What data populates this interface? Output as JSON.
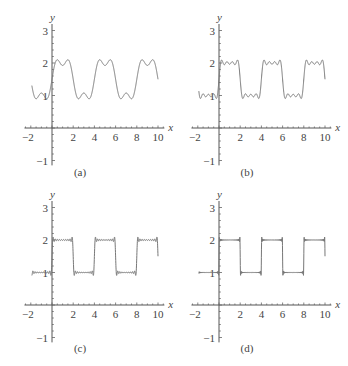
{
  "chart_data": [
    {
      "type": "line",
      "panel_label": "(a)",
      "title": "",
      "xlabel": "x",
      "ylabel": "y",
      "xlim": [
        -2,
        10
      ],
      "ylim": [
        -1,
        3
      ],
      "xticks": [
        "-2",
        "2",
        "4",
        "6",
        "8",
        "10"
      ],
      "yticks": [
        "3",
        "2",
        "1",
        "-1"
      ],
      "description": "Fourier partial sum of square wave (period 4, values 2 on (0,2), 1 on (2,4)), few terms",
      "harmonics": 3,
      "series": [
        {
          "name": "partial sum",
          "square_wave": {
            "high": 2,
            "low": 1,
            "period": 4
          }
        }
      ]
    },
    {
      "type": "line",
      "panel_label": "(b)",
      "xlabel": "x",
      "ylabel": "y",
      "xlim": [
        -2,
        10
      ],
      "ylim": [
        -1,
        3
      ],
      "xticks": [
        "-2",
        "2",
        "4",
        "6",
        "8",
        "10"
      ],
      "yticks": [
        "3",
        "2",
        "1",
        "-1"
      ],
      "harmonics": 7,
      "series": [
        {
          "name": "partial sum",
          "square_wave": {
            "high": 2,
            "low": 1,
            "period": 4
          }
        }
      ]
    },
    {
      "type": "line",
      "panel_label": "(c)",
      "xlabel": "x",
      "ylabel": "y",
      "xlim": [
        -2,
        10
      ],
      "ylim": [
        -1,
        3
      ],
      "xticks": [
        "-2",
        "2",
        "4",
        "6",
        "8",
        "10"
      ],
      "yticks": [
        "3",
        "2",
        "1",
        "-1"
      ],
      "harmonics": 20,
      "series": [
        {
          "name": "partial sum",
          "square_wave": {
            "high": 2,
            "low": 1,
            "period": 4
          }
        }
      ]
    },
    {
      "type": "line",
      "panel_label": "(d)",
      "xlabel": "x",
      "ylabel": "y",
      "xlim": [
        -2,
        10
      ],
      "ylim": [
        -1,
        3
      ],
      "xticks": [
        "-2",
        "2",
        "4",
        "6",
        "8",
        "10"
      ],
      "yticks": [
        "3",
        "2",
        "1",
        "-1"
      ],
      "harmonics": 60,
      "series": [
        {
          "name": "partial sum",
          "square_wave": {
            "high": 2,
            "low": 1,
            "period": 4
          }
        }
      ]
    }
  ],
  "panels": [
    {
      "label": "(a)",
      "ox": 52,
      "oy": 128,
      "cx": 80,
      "cy": 176
    },
    {
      "label": "(b)",
      "ox": 219,
      "oy": 128,
      "cx": 247,
      "cy": 176
    },
    {
      "label": "(c)",
      "ox": 52,
      "oy": 305,
      "cx": 80,
      "cy": 352
    },
    {
      "label": "(d)",
      "ox": 219,
      "oy": 305,
      "cx": 247,
      "cy": 352
    }
  ]
}
